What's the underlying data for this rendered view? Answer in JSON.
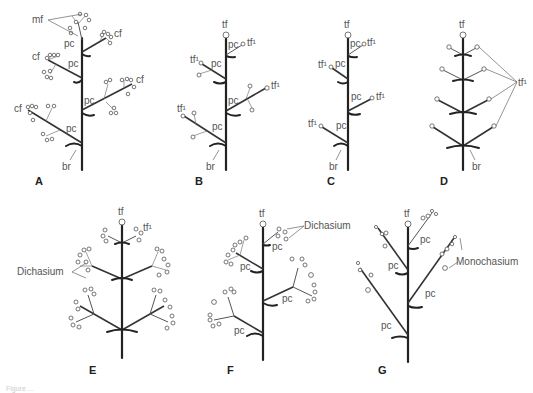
{
  "figure": {
    "caption_partial": "Figure ..."
  },
  "labels": {
    "mf": "mf",
    "cf": "cf",
    "pc": "pc",
    "tf": "tf",
    "tf1": "tf¹",
    "br": "br",
    "dichasium": "Dichasium",
    "monochasium": "Monochasium"
  },
  "panels": [
    {
      "id": "A",
      "label": "A",
      "type": "compound raceme with cymose flowers",
      "annotations": [
        "mf",
        "cf",
        "cf",
        "cf",
        "cf",
        "pc",
        "pc",
        "pc",
        "pc",
        "br"
      ]
    },
    {
      "id": "B",
      "label": "B",
      "type": "thyrse/determinate",
      "annotations": [
        "tf",
        "tf¹",
        "tf¹",
        "tf¹",
        "tf¹",
        "pc",
        "pc",
        "pc",
        "pc",
        "br"
      ]
    },
    {
      "id": "C",
      "label": "C",
      "type": "determinate",
      "annotations": [
        "tf",
        "tf¹",
        "tf¹",
        "tf¹",
        "tf¹",
        "pc",
        "pc",
        "pc",
        "pc",
        "br"
      ]
    },
    {
      "id": "D",
      "label": "D",
      "type": "decussate",
      "annotations": [
        "tf",
        "tf¹",
        "br"
      ]
    },
    {
      "id": "E",
      "label": "E",
      "type": "dichasial",
      "annotations": [
        "tf",
        "tf¹",
        "Dichasium"
      ]
    },
    {
      "id": "F",
      "label": "F",
      "type": "dichasial alternate",
      "annotations": [
        "tf",
        "Dichasium",
        "pc",
        "pc",
        "pc",
        "pc"
      ]
    },
    {
      "id": "G",
      "label": "G",
      "type": "monochasial",
      "annotations": [
        "tf",
        "Monochasium",
        "pc",
        "pc",
        "pc",
        "pc"
      ]
    }
  ]
}
